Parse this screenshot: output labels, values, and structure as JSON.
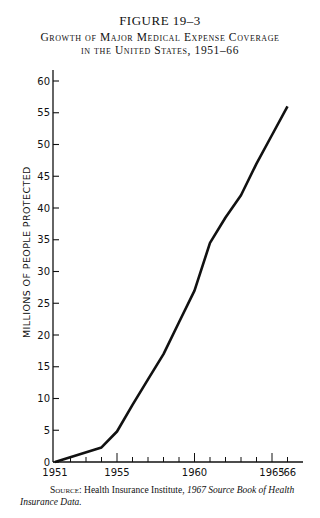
{
  "figure": {
    "label": "FIGURE 19–3",
    "title_line1": "Growth of Major Medical Expense Coverage",
    "title_line2": "in the United States, 1951–66"
  },
  "source": {
    "prefix": "Source:",
    "text": " Health Insurance Institute, ",
    "italic": "1967 Source Book of Health Insurance Data."
  },
  "chart_data": {
    "type": "line",
    "xlabel": "",
    "ylabel": "MILLIONS OF PEOPLE PROTECTED",
    "x": [
      1951,
      1954,
      1955,
      1956,
      1957,
      1958,
      1959,
      1960,
      1961,
      1962,
      1963,
      1964,
      1965,
      1966
    ],
    "series": [
      {
        "name": "Major medical coverage",
        "values": [
          0,
          2.3,
          4.8,
          9,
          13,
          17,
          22,
          27,
          34.5,
          38.5,
          42,
          47,
          51.5,
          56
        ]
      }
    ],
    "xticks_major": [
      1951,
      1955,
      1960,
      1965
    ],
    "xtick_labels": [
      "1951",
      "1955",
      "1960",
      "1965",
      "'66"
    ],
    "yticks": [
      0,
      5,
      10,
      15,
      20,
      25,
      30,
      35,
      40,
      45,
      50,
      55,
      60
    ],
    "xlim": [
      1951,
      1967
    ],
    "ylim": [
      0,
      61
    ],
    "grid": false,
    "legend": "none"
  }
}
